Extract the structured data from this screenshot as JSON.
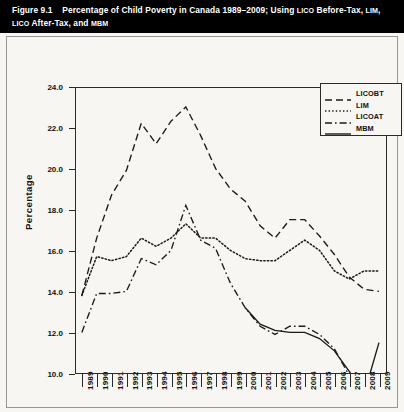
{
  "figure": {
    "title_prefix": "Figure 9.1"
  },
  "chart_data": {
    "type": "line",
    "title": "Percentage of Child Poverty in Canada 1989–2009; Using LICO Before-Tax, LIM, LICO After-Tax, and MBM",
    "xlabel": "Year",
    "ylabel": "Percentage",
    "ylim": [
      10.0,
      24.0
    ],
    "yticks": [
      "10.0",
      "12.0",
      "14.0",
      "16.0",
      "18.0",
      "20.0",
      "22.0",
      "24.0"
    ],
    "ytick_values": [
      10.0,
      12.0,
      14.0,
      16.0,
      18.0,
      20.0,
      22.0,
      24.0
    ],
    "grid": false,
    "legend_position": "top-right",
    "categories": [
      "1989",
      "1990",
      "1991",
      "1992",
      "1993",
      "1994",
      "1995",
      "1996",
      "1997",
      "1998",
      "1999",
      "2000",
      "2001",
      "2002",
      "2003",
      "2004",
      "2005",
      "2006",
      "2007",
      "2008",
      "2009"
    ],
    "series": [
      {
        "name": "LICOBT",
        "style": "dashed",
        "color": "#1a1a1a",
        "values": [
          13.8,
          16.6,
          18.7,
          19.9,
          22.2,
          21.2,
          22.3,
          23.0,
          21.6,
          20.0,
          19.0,
          18.4,
          17.2,
          16.6,
          17.5,
          17.5,
          16.7,
          15.8,
          14.7,
          14.1,
          14.0
        ]
      },
      {
        "name": "LIM",
        "style": "dotted",
        "color": "#1a1a1a",
        "values": [
          13.8,
          15.7,
          15.5,
          15.7,
          16.6,
          16.2,
          16.6,
          17.3,
          16.6,
          16.6,
          16.0,
          15.6,
          15.5,
          15.5,
          16.0,
          16.5,
          16.0,
          15.0,
          14.6,
          15.0,
          15.0
        ]
      },
      {
        "name": "LICOAT",
        "style": "dashdot",
        "color": "#1a1a1a",
        "values": [
          12.0,
          13.9,
          13.9,
          14.0,
          15.6,
          15.3,
          16.0,
          18.2,
          16.5,
          16.1,
          14.4,
          13.2,
          12.3,
          11.9,
          12.3,
          12.3,
          11.9,
          11.2,
          9.9,
          9.4,
          9.2
        ]
      },
      {
        "name": "MBM",
        "style": "solid",
        "color": "#1a1a1a",
        "values": [
          null,
          null,
          null,
          null,
          null,
          null,
          null,
          null,
          null,
          null,
          null,
          13.2,
          12.4,
          12.1,
          12.0,
          12.0,
          11.7,
          11.1,
          10.1,
          9.0,
          11.5
        ]
      }
    ]
  },
  "legend": {
    "items": [
      {
        "label": "LICOBT",
        "style": "dashed"
      },
      {
        "label": "LIM",
        "style": "dotted"
      },
      {
        "label": "LICOAT",
        "style": "dashdot"
      },
      {
        "label": "MBM",
        "style": "solid"
      }
    ]
  }
}
